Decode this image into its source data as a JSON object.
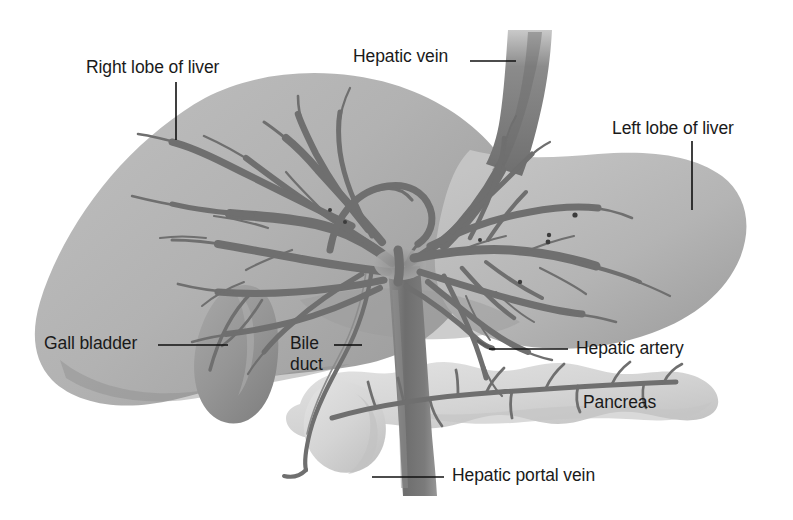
{
  "figure": {
    "kind": "anatomical-diagram",
    "background_color": "#ffffff",
    "palette": {
      "liver_light": "#c3c3c3",
      "liver_mid": "#aeaeae",
      "liver_dark": "#8f8f8f",
      "gallbladder": "#9a9a9a",
      "pancreas": "#dcdcdc",
      "pancreas_shade": "#c6c6c6",
      "vessel": "#6f6f6f",
      "vessel_dark": "#5c5c5c",
      "leader_line": "#101010",
      "label_text": "#1a1a1a"
    }
  },
  "labels": [
    {
      "id": "right-lobe-of-liver",
      "text": "Right lobe of liver",
      "x": 86,
      "y": 57,
      "leader": {
        "x1": 176,
        "y1": 82,
        "x2": 176,
        "y2": 140
      }
    },
    {
      "id": "hepatic-vein",
      "text": "Hepatic vein",
      "x": 353,
      "y": 46,
      "leader": {
        "x1": 470,
        "y1": 61,
        "x2": 516,
        "y2": 61
      }
    },
    {
      "id": "left-lobe-of-liver",
      "text": "Left lobe of liver",
      "x": 612,
      "y": 118,
      "leader": {
        "x1": 692,
        "y1": 141,
        "x2": 692,
        "y2": 210
      }
    },
    {
      "id": "gall-bladder",
      "text": "Gall bladder",
      "x": 44,
      "y": 333,
      "leader": {
        "x1": 158,
        "y1": 345,
        "x2": 228,
        "y2": 345
      }
    },
    {
      "id": "bile-duct",
      "text": "Bile\nduct",
      "x": 290,
      "y": 333,
      "leader": {
        "x1": 334,
        "y1": 345,
        "x2": 362,
        "y2": 345
      }
    },
    {
      "id": "hepatic-artery",
      "text": "Hepatic artery",
      "x": 576,
      "y": 338,
      "leader": {
        "x1": 489,
        "y1": 349,
        "x2": 568,
        "y2": 349
      }
    },
    {
      "id": "pancreas",
      "text": "Pancreas",
      "x": 583,
      "y": 392,
      "leader": null
    },
    {
      "id": "hepatic-portal-vein",
      "text": "Hepatic portal vein",
      "x": 452,
      "y": 465,
      "leader": {
        "x1": 372,
        "y1": 477,
        "x2": 444,
        "y2": 477
      }
    }
  ],
  "structures": [
    {
      "id": "right-lobe",
      "name": "Right lobe of liver"
    },
    {
      "id": "left-lobe",
      "name": "Left lobe of liver"
    },
    {
      "id": "gall-bladder",
      "name": "Gall bladder"
    },
    {
      "id": "bile-duct",
      "name": "Bile duct"
    },
    {
      "id": "hepatic-vein",
      "name": "Hepatic vein"
    },
    {
      "id": "hepatic-artery",
      "name": "Hepatic artery"
    },
    {
      "id": "hepatic-portal-vein",
      "name": "Hepatic portal vein"
    },
    {
      "id": "pancreas",
      "name": "Pancreas"
    },
    {
      "id": "pancreatic-duct",
      "name": "Pancreatic duct"
    }
  ]
}
